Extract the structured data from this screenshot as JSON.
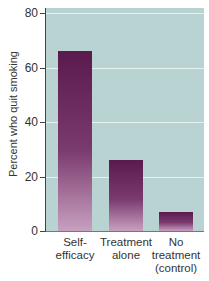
{
  "chart_data": {
    "type": "bar",
    "title": "",
    "xlabel": "",
    "ylabel": "Percent who quit smoking",
    "ylim": [
      0,
      80
    ],
    "yticks": [
      0,
      20,
      40,
      60,
      80
    ],
    "grid": true,
    "categories": [
      "Self-efficacy",
      "Treatment alone",
      "No treatment (control)"
    ],
    "category_lines": [
      [
        "Self-",
        "efficacy"
      ],
      [
        "Treatment",
        "alone"
      ],
      [
        "No",
        "treatment",
        "(control)"
      ]
    ],
    "values": [
      66,
      26,
      7
    ],
    "colors": {
      "bar_top": "#5a1a4e",
      "bar_bottom": "#c8a0c0",
      "plot_bg": "#b9d3d3",
      "grid": "#e6f2f2"
    }
  }
}
